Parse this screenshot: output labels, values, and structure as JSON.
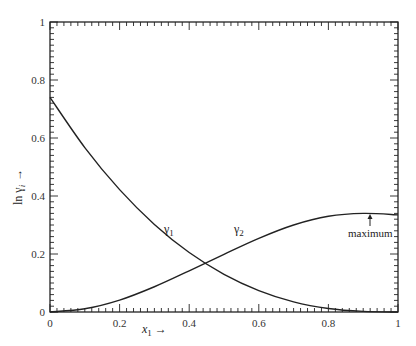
{
  "chart_data": {
    "type": "line",
    "title": "",
    "xlabel": "x₁ →",
    "ylabel": "ln γᵢ →",
    "xlim": [
      0,
      1
    ],
    "ylim": [
      0,
      1
    ],
    "grid": false,
    "x_ticks": [
      "0",
      "0.2",
      "0.4",
      "0.6",
      "0.8",
      "1"
    ],
    "y_ticks": [
      "0",
      "0.2",
      "0.4",
      "0.6",
      "0.8",
      "1"
    ],
    "series": [
      {
        "name": "γ₁",
        "x": [
          0,
          0.1,
          0.2,
          0.3,
          0.4,
          0.5,
          0.6,
          0.7,
          0.8,
          0.9,
          1.0
        ],
        "values": [
          0.74,
          0.567,
          0.422,
          0.302,
          0.205,
          0.13,
          0.074,
          0.035,
          0.012,
          0.002,
          0.0
        ]
      },
      {
        "name": "γ₂",
        "x": [
          0,
          0.1,
          0.2,
          0.3,
          0.4,
          0.5,
          0.6,
          0.7,
          0.8,
          0.9,
          1.0
        ],
        "values": [
          0.0,
          0.011,
          0.041,
          0.087,
          0.142,
          0.199,
          0.254,
          0.3,
          0.33,
          0.34,
          0.335
        ]
      }
    ],
    "annotations": [
      {
        "text": "γ₁",
        "x": 0.32,
        "y": 0.27
      },
      {
        "text": "γ₂",
        "x": 0.54,
        "y": 0.27
      },
      {
        "text": "maximum",
        "x": 0.92,
        "y": 0.34,
        "arrow": true
      }
    ]
  },
  "labels": {
    "xlabel_var": "x",
    "xlabel_sub": "1",
    "xlabel_arrow": "→",
    "ylabel": "ln γ",
    "ylabel_sub": "i",
    "ylabel_arrow": "→",
    "gamma1": "γ",
    "gamma1_sub": "1",
    "gamma2": "γ",
    "gamma2_sub": "2",
    "maximum": "maximum"
  }
}
